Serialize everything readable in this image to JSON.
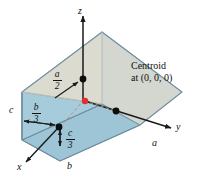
{
  "figure": {
    "colors": {
      "top_face": "#dcdbcf",
      "front_face": "#9dc5d6",
      "bottom_face": "#9dc5d6",
      "right_face": "#c9d2cd",
      "outline": "#6f8fa3",
      "axis": "#1a1a1a",
      "centroid": "#e03030",
      "dashed": "#b08a6a"
    },
    "axes": [
      {
        "name": "z-axis",
        "label": "z"
      },
      {
        "name": "y-axis",
        "label": "y"
      },
      {
        "name": "x-axis",
        "label": "x"
      }
    ],
    "dimension_labels": [
      {
        "name": "edge-a",
        "label": "a"
      },
      {
        "name": "edge-b",
        "label": "b"
      },
      {
        "name": "edge-c",
        "label": "c"
      }
    ],
    "fractions": [
      {
        "name": "a-over-2",
        "numerator": "a",
        "denominator": "2"
      },
      {
        "name": "b-over-3",
        "numerator": "b",
        "denominator": "3"
      },
      {
        "name": "c-over-3",
        "numerator": "c",
        "denominator": "3"
      }
    ],
    "annotation": {
      "line1": "Centroid",
      "line2": "at (0, 0, 0)"
    }
  }
}
